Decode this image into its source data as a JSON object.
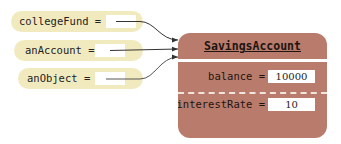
{
  "references": [
    {
      "name": "collegeFund",
      "label": "collegeFund ="
    },
    {
      "name": "anAccount",
      "label": "anAccount ="
    },
    {
      "name": "anObject",
      "label": "anObject ="
    }
  ],
  "object": {
    "class_name": "SavingsAccount",
    "fields": [
      {
        "label": "balance =",
        "value": "10000"
      },
      {
        "label": "interestRate =",
        "value": "10"
      }
    ]
  },
  "colors": {
    "reference_fill": "#f2eabf",
    "object_fill": "#b97c6c",
    "arrow": "#333333"
  }
}
